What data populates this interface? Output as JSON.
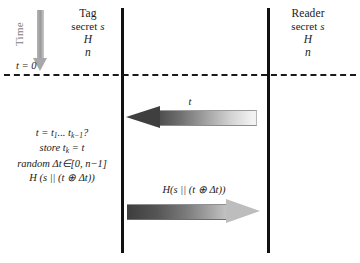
{
  "figure": {
    "type": "protocol-sequence-diagram",
    "background": "#ffffff"
  },
  "time_axis": {
    "label": "Time",
    "zero_label": "t = 0",
    "direction": "downward",
    "arrow_color": "#a8a8a8"
  },
  "actors": [
    {
      "id": "tag",
      "name": "Tag",
      "secret_label": "secret",
      "secret_symbol": "s",
      "hash_symbol": "H",
      "counter_symbol": "n",
      "lifeline_color": "#111111"
    },
    {
      "id": "reader",
      "name": "Reader",
      "secret_label": "secret",
      "secret_symbol": "s",
      "hash_symbol": "H",
      "counter_symbol": "n",
      "lifeline_color": "#111111"
    }
  ],
  "tag_computation": {
    "lines": [
      "t = t1... tk−1?",
      "store tk = t",
      "random Δt∈[0, n−1]",
      "H (s || (t ⊕ Δt))"
    ],
    "line1_prefix": "t = t",
    "line1_sub1": "1",
    "line1_mid": "... t",
    "line1_sub2": "k−1",
    "line1_suffix": "?",
    "line2_prefix": "store t",
    "line2_sub": "k",
    "line2_suffix": " = t",
    "line3": "random Δt∈[0, n−1]",
    "line4": "H (s || (t ⊕ Δt))"
  },
  "messages": [
    {
      "id": "challenge",
      "label": "t",
      "direction": "reader-to-tag",
      "head_color": "#3f3f3f",
      "gradient_from": "#4c4c4c",
      "gradient_to": "#f2f2f2"
    },
    {
      "id": "response",
      "label": "H(s || (t ⊕ Δt))",
      "direction": "tag-to-reader",
      "head_color": "#bdbdbd",
      "gradient_from": "#3d3d3d",
      "gradient_to": "#c4c4c4"
    }
  ]
}
